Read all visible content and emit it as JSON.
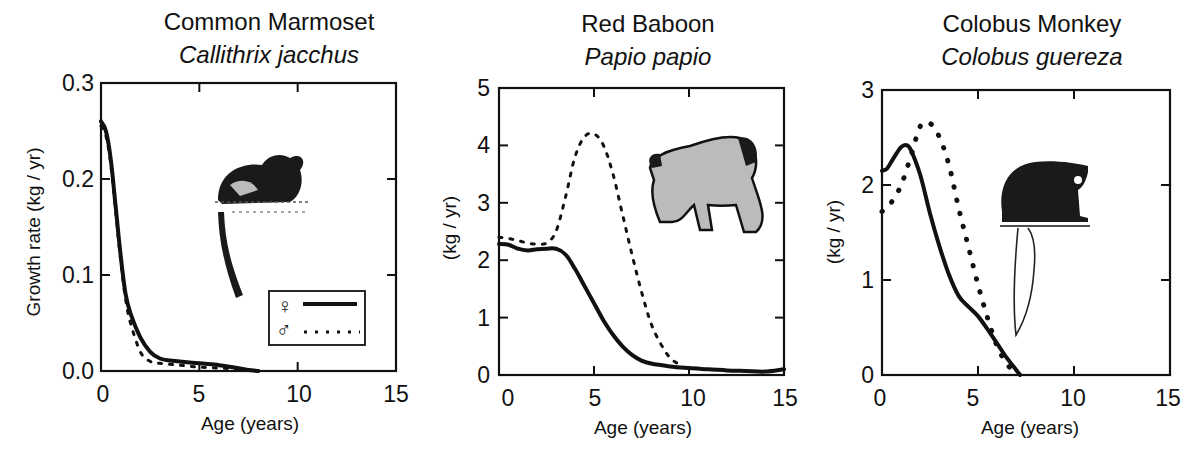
{
  "figure": {
    "panels": [
      {
        "title": "Common Marmoset",
        "subtitle": "Callithrix jacchus",
        "ylabel": "Growth  rate (kg / yr)",
        "xlabel": "Age (years)",
        "yticks": [
          "0.0",
          "0.1",
          "0.2",
          "0.3"
        ],
        "xticks": [
          "0",
          "5",
          "10",
          "15"
        ],
        "legend": {
          "female_symbol": "♀",
          "male_symbol": "♂"
        },
        "illustration": "marmoset-illustration"
      },
      {
        "title": "Red Baboon",
        "subtitle": "Papio papio",
        "ylabel": "(kg / yr)",
        "xlabel": "Age (years)",
        "yticks": [
          "0",
          "1",
          "2",
          "3",
          "4",
          "5"
        ],
        "xticks": [
          "0",
          "5",
          "10",
          "15"
        ],
        "illustration": "baboon-illustration"
      },
      {
        "title": "Colobus Monkey",
        "subtitle": "Colobus guereza",
        "ylabel": "(kg / yr)",
        "xlabel": "Age (years)",
        "yticks": [
          "0",
          "1",
          "2",
          "3"
        ],
        "xticks": [
          "0",
          "5",
          "10",
          "15"
        ],
        "illustration": "colobus-illustration"
      }
    ]
  },
  "chart_data": [
    {
      "type": "line",
      "title": "Common Marmoset (Callithrix jacchus)",
      "xlabel": "Age (years)",
      "ylabel": "Growth rate (kg / yr)",
      "xlim": [
        0,
        15
      ],
      "ylim": [
        0,
        0.3
      ],
      "xticks": [
        0,
        5,
        10,
        15
      ],
      "yticks": [
        0.0,
        0.1,
        0.2,
        0.3
      ],
      "grid": false,
      "legend": {
        "position": "lower right",
        "entries": [
          "♀ (solid)",
          "♂ (dashed)"
        ]
      },
      "series": [
        {
          "name": "Female",
          "style": "solid",
          "x": [
            0,
            0.25,
            0.5,
            0.75,
            1.0,
            1.25,
            1.5,
            2.0,
            2.5,
            3.0,
            3.5,
            4,
            5,
            6,
            7,
            7.5,
            8
          ],
          "y": [
            0.26,
            0.25,
            0.22,
            0.17,
            0.12,
            0.08,
            0.06,
            0.035,
            0.02,
            0.013,
            0.011,
            0.01,
            0.008,
            0.006,
            0.003,
            0.001,
            0.0
          ]
        },
        {
          "name": "Male",
          "style": "dashed",
          "x": [
            0,
            0.25,
            0.5,
            0.75,
            1.0,
            1.25,
            1.5,
            2.0,
            2.5,
            3.0,
            4,
            5,
            6,
            7,
            8
          ],
          "y": [
            0.255,
            0.245,
            0.215,
            0.165,
            0.115,
            0.075,
            0.05,
            0.02,
            0.01,
            0.008,
            0.006,
            0.004,
            0.003,
            0.002,
            0.0
          ]
        }
      ]
    },
    {
      "type": "line",
      "title": "Red Baboon (Papio papio)",
      "xlabel": "Age (years)",
      "ylabel": "(kg / yr)",
      "xlim": [
        0,
        15
      ],
      "ylim": [
        0,
        5
      ],
      "xticks": [
        0,
        5,
        10,
        15
      ],
      "yticks": [
        0,
        1,
        2,
        3,
        4,
        5
      ],
      "grid": false,
      "series": [
        {
          "name": "Female",
          "style": "solid",
          "x": [
            0,
            0.5,
            1,
            1.5,
            2,
            2.5,
            3,
            3.5,
            4,
            4.5,
            5,
            5.5,
            6,
            6.5,
            7,
            7.5,
            8,
            9,
            10,
            11,
            12,
            13,
            14,
            15
          ],
          "y": [
            2.28,
            2.27,
            2.2,
            2.17,
            2.19,
            2.2,
            2.2,
            2.1,
            1.85,
            1.55,
            1.25,
            0.95,
            0.7,
            0.5,
            0.35,
            0.25,
            0.2,
            0.15,
            0.12,
            0.1,
            0.08,
            0.07,
            0.06,
            0.1
          ]
        },
        {
          "name": "Male",
          "style": "dashed",
          "x": [
            0,
            0.5,
            1,
            1.5,
            2,
            2.5,
            3,
            3.5,
            4,
            4.5,
            5,
            5.5,
            6,
            6.5,
            7,
            7.5,
            8,
            8.5,
            9,
            9.5
          ],
          "y": [
            2.4,
            2.38,
            2.34,
            2.3,
            2.28,
            2.3,
            2.5,
            3.1,
            3.8,
            4.15,
            4.2,
            4.0,
            3.5,
            2.8,
            2.1,
            1.45,
            0.9,
            0.55,
            0.3,
            0.18
          ]
        }
      ]
    },
    {
      "type": "line",
      "title": "Colobus Monkey (Colobus guereza)",
      "xlabel": "Age (years)",
      "ylabel": "(kg / yr)",
      "xlim": [
        0,
        15
      ],
      "ylim": [
        0,
        3
      ],
      "xticks": [
        0,
        5,
        10,
        15
      ],
      "yticks": [
        0,
        1,
        2,
        3
      ],
      "grid": false,
      "series": [
        {
          "name": "Female",
          "style": "solid",
          "x": [
            0,
            0.25,
            0.5,
            0.75,
            1.0,
            1.25,
            1.5,
            2.0,
            2.5,
            3.0,
            3.5,
            4.0,
            4.5,
            5.0,
            5.5,
            6.0,
            6.5,
            7.0,
            7.2
          ],
          "y": [
            2.15,
            2.17,
            2.25,
            2.33,
            2.4,
            2.42,
            2.37,
            2.1,
            1.7,
            1.35,
            1.05,
            0.83,
            0.72,
            0.62,
            0.48,
            0.33,
            0.18,
            0.05,
            0.0
          ]
        },
        {
          "name": "Male",
          "style": "dotted",
          "x": [
            0,
            0.5,
            1.0,
            1.5,
            2.0,
            2.5,
            3.0,
            3.5,
            4.0,
            4.5,
            5.0,
            5.5,
            6.0,
            6.5,
            7.0
          ],
          "y": [
            1.72,
            1.82,
            2.0,
            2.3,
            2.62,
            2.65,
            2.5,
            2.2,
            1.75,
            1.35,
            0.95,
            0.6,
            0.3,
            0.12,
            0.0
          ]
        }
      ]
    }
  ]
}
